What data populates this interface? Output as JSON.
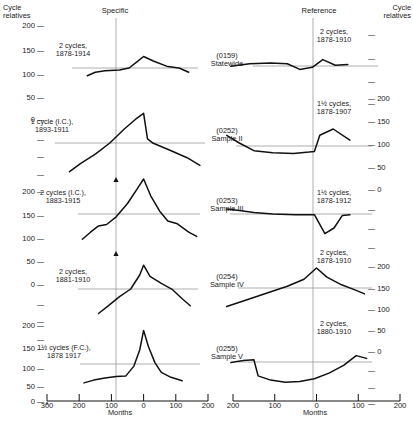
{
  "figure": {
    "left_axis_title": "Cycle\nrelatives",
    "right_axis_title": "Cycle\nrelatives",
    "column_headers": {
      "specific": "Specific",
      "reference": "Reference"
    },
    "x_axis_label_left": "Months",
    "x_axis_label_right": "Months"
  },
  "left_axis_ticks": [
    {
      "label": "200",
      "y": 27
    },
    {
      "label": "150",
      "y": 52
    },
    {
      "label": "100",
      "y": 75
    },
    {
      "label": "50",
      "y": 97
    },
    {
      "label": "0",
      "y": 119
    },
    {
      "label": "",
      "y": 141
    },
    {
      "label": "",
      "y": 160
    },
    {
      "label": "",
      "y": 179
    },
    {
      "label": "200",
      "y": 196
    },
    {
      "label": "150",
      "y": 219
    },
    {
      "label": "100",
      "y": 241
    },
    {
      "label": "50",
      "y": 262
    },
    {
      "label": "0",
      "y": 283
    },
    {
      "label": "",
      "y": 302
    },
    {
      "label": "",
      "y": 320
    },
    {
      "label": "",
      "y": 338
    },
    {
      "label": "200",
      "y": 327
    },
    {
      "label": "150",
      "y": 350
    },
    {
      "label": "100",
      "y": 370
    },
    {
      "label": "50",
      "y": 388
    },
    {
      "label": "0",
      "y": 404
    }
  ],
  "right_axis_ticks": [
    {
      "label": "",
      "y": 37
    },
    {
      "label": "",
      "y": 62
    },
    {
      "label": "",
      "y": 85
    },
    {
      "label": "",
      "y": 107
    },
    {
      "label": "200",
      "y": 100
    },
    {
      "label": "150",
      "y": 123
    },
    {
      "label": "100",
      "y": 145
    },
    {
      "label": "50",
      "y": 167
    },
    {
      "label": "0",
      "y": 189
    },
    {
      "label": "",
      "y": 210
    },
    {
      "label": "",
      "y": 230
    },
    {
      "label": "",
      "y": 250
    },
    {
      "label": "200",
      "y": 268
    },
    {
      "label": "150",
      "y": 290
    },
    {
      "label": "100",
      "y": 311
    },
    {
      "label": "50",
      "y": 332
    },
    {
      "label": "0",
      "y": 353
    },
    {
      "label": "",
      "y": 372
    },
    {
      "label": "",
      "y": 389
    },
    {
      "label": "",
      "y": 405
    }
  ],
  "x_ticks_left": [
    "300",
    "200",
    "100",
    "0",
    "100",
    "200"
  ],
  "x_ticks_right": [
    "200",
    "100",
    "0",
    "100",
    "200"
  ],
  "rows": [
    {
      "center_label": "(0159)\nStatewide",
      "left_annotation": "2 cycles,\n1878-1914",
      "right_annotation": "2 cycles,\n1878-1910"
    },
    {
      "center_label": "(0252)\nSample II",
      "left_annotation": "1 cycle (I.C.),\n1893-1911",
      "right_annotation": "1½ cycles,\n1878-1907"
    },
    {
      "center_label": "(0253)\nSample III",
      "left_annotation": "2 cycles (I.C.),\n1883-1915",
      "right_annotation": "1½ cycles,\n1878-1912"
    },
    {
      "center_label": "(0254)\nSample IV",
      "left_annotation": "2 cycles,\n1881-1910",
      "right_annotation": "2 cycles,\n1878-1910"
    },
    {
      "center_label": "(0255)\nSample V",
      "left_annotation": "1½ cycles (F.C.),\n1878 1917",
      "right_annotation": "2 cycles,\n1880-1910"
    }
  ],
  "chart_data": {
    "type": "line",
    "title": "",
    "xlabel": "Months",
    "ylabel": "Cycle relatives",
    "grid": false,
    "legend": "none",
    "xlim": [
      -300,
      200
    ],
    "panels": [
      {
        "id": "0159-specific",
        "name": "(0159) Statewide - Specific",
        "annotation": "2 cycles, 1878-1914",
        "baseline": 100,
        "points": [
          {
            "x": -175,
            "y": 78
          },
          {
            "x": -150,
            "y": 88
          },
          {
            "x": -120,
            "y": 92
          },
          {
            "x": -75,
            "y": 94
          },
          {
            "x": -45,
            "y": 100
          },
          {
            "x": -20,
            "y": 118
          },
          {
            "x": 0,
            "y": 133
          },
          {
            "x": 30,
            "y": 120
          },
          {
            "x": 75,
            "y": 104
          },
          {
            "x": 110,
            "y": 100
          },
          {
            "x": 140,
            "y": 88
          }
        ]
      },
      {
        "id": "0159-reference",
        "name": "(0159) Statewide - Reference",
        "annotation": "2 cycles, 1878-1910",
        "baseline": 100,
        "points": [
          {
            "x": -205,
            "y": 105
          },
          {
            "x": -160,
            "y": 112
          },
          {
            "x": -110,
            "y": 114
          },
          {
            "x": -70,
            "y": 112
          },
          {
            "x": -40,
            "y": 96
          },
          {
            "x": -10,
            "y": 102
          },
          {
            "x": 15,
            "y": 124
          },
          {
            "x": 45,
            "y": 108
          },
          {
            "x": 75,
            "y": 110
          }
        ]
      },
      {
        "id": "0252-specific",
        "name": "(0252) Sample II - Specific",
        "annotation": "1 cycle (I.C.), 1893-1911",
        "baseline": 100,
        "points": [
          {
            "x": -230,
            "y": 18
          },
          {
            "x": -195,
            "y": 42
          },
          {
            "x": -150,
            "y": 68
          },
          {
            "x": -105,
            "y": 100
          },
          {
            "x": -60,
            "y": 140
          },
          {
            "x": -25,
            "y": 168
          },
          {
            "x": 0,
            "y": 185
          },
          {
            "x": 12,
            "y": 112
          },
          {
            "x": 30,
            "y": 99
          },
          {
            "x": 80,
            "y": 80
          },
          {
            "x": 135,
            "y": 58
          },
          {
            "x": 175,
            "y": 36
          }
        ]
      },
      {
        "id": "0252-reference",
        "name": "(0252) Sample II - Reference",
        "annotation": "1½ cycles, 1878-1907",
        "baseline": 100,
        "points": [
          {
            "x": -215,
            "y": 122
          },
          {
            "x": -185,
            "y": 100
          },
          {
            "x": -150,
            "y": 78
          },
          {
            "x": -105,
            "y": 72
          },
          {
            "x": -55,
            "y": 70
          },
          {
            "x": -18,
            "y": 74
          },
          {
            "x": -5,
            "y": 76
          },
          {
            "x": 8,
            "y": 122
          },
          {
            "x": 40,
            "y": 140
          },
          {
            "x": 80,
            "y": 108
          }
        ]
      },
      {
        "id": "0253-specific",
        "name": "(0253) Sample III - Specific",
        "annotation": "2 cycles (I.C.), 1883-1915",
        "baseline": 100,
        "points": [
          {
            "x": -190,
            "y": 28
          },
          {
            "x": -165,
            "y": 48
          },
          {
            "x": -140,
            "y": 66
          },
          {
            "x": -115,
            "y": 70
          },
          {
            "x": -85,
            "y": 92
          },
          {
            "x": -50,
            "y": 130
          },
          {
            "x": -20,
            "y": 172
          },
          {
            "x": 0,
            "y": 200
          },
          {
            "x": 22,
            "y": 152
          },
          {
            "x": 50,
            "y": 108
          },
          {
            "x": 75,
            "y": 80
          },
          {
            "x": 105,
            "y": 72
          },
          {
            "x": 140,
            "y": 48
          },
          {
            "x": 165,
            "y": 36
          }
        ]
      },
      {
        "id": "0253-reference",
        "name": "(0253) Sample III - Reference",
        "annotation": "1½ cycles, 1878-1912",
        "baseline": 100,
        "points": [
          {
            "x": -215,
            "y": 114
          },
          {
            "x": -185,
            "y": 110
          },
          {
            "x": -150,
            "y": 104
          },
          {
            "x": -105,
            "y": 100
          },
          {
            "x": -50,
            "y": 98
          },
          {
            "x": -5,
            "y": 98
          },
          {
            "x": 20,
            "y": 44
          },
          {
            "x": 42,
            "y": 60
          },
          {
            "x": 62,
            "y": 96
          },
          {
            "x": 80,
            "y": 98
          }
        ]
      },
      {
        "id": "0254-specific",
        "name": "(0254) Sample IV - Specific",
        "annotation": "2 cycles, 1881-1910",
        "baseline": 100,
        "points": [
          {
            "x": -140,
            "y": 30
          },
          {
            "x": -110,
            "y": 52
          },
          {
            "x": -75,
            "y": 78
          },
          {
            "x": -40,
            "y": 100
          },
          {
            "x": -12,
            "y": 140
          },
          {
            "x": 0,
            "y": 168
          },
          {
            "x": 20,
            "y": 136
          },
          {
            "x": 55,
            "y": 116
          },
          {
            "x": 90,
            "y": 98
          },
          {
            "x": 120,
            "y": 72
          },
          {
            "x": 145,
            "y": 52
          }
        ]
      },
      {
        "id": "0254-reference",
        "name": "(0254) Sample IV - Reference",
        "annotation": "2 cycles, 1878-1910",
        "baseline": 100,
        "points": [
          {
            "x": -215,
            "y": 50
          },
          {
            "x": -170,
            "y": 68
          },
          {
            "x": -120,
            "y": 88
          },
          {
            "x": -70,
            "y": 108
          },
          {
            "x": -30,
            "y": 128
          },
          {
            "x": 0,
            "y": 160
          },
          {
            "x": 25,
            "y": 134
          },
          {
            "x": 60,
            "y": 112
          },
          {
            "x": 95,
            "y": 96
          },
          {
            "x": 115,
            "y": 86
          }
        ]
      },
      {
        "id": "0255-specific",
        "name": "(0255) Sample V - Specific",
        "annotation": "1½ cycles (F.C.), 1878 1917",
        "baseline": 100,
        "points": [
          {
            "x": -185,
            "y": 46
          },
          {
            "x": -155,
            "y": 54
          },
          {
            "x": -120,
            "y": 60
          },
          {
            "x": -85,
            "y": 64
          },
          {
            "x": -55,
            "y": 66
          },
          {
            "x": -30,
            "y": 94
          },
          {
            "x": -12,
            "y": 140
          },
          {
            "x": 0,
            "y": 196
          },
          {
            "x": 15,
            "y": 150
          },
          {
            "x": 35,
            "y": 104
          },
          {
            "x": 55,
            "y": 76
          },
          {
            "x": 85,
            "y": 62
          },
          {
            "x": 120,
            "y": 52
          }
        ]
      },
      {
        "id": "0255-reference",
        "name": "(0255) Sample V - Reference",
        "annotation": "2 cycles, 1880-1910",
        "baseline": 100,
        "points": [
          {
            "x": -205,
            "y": 104
          },
          {
            "x": -175,
            "y": 110
          },
          {
            "x": -150,
            "y": 112
          },
          {
            "x": -140,
            "y": 66
          },
          {
            "x": -110,
            "y": 54
          },
          {
            "x": -75,
            "y": 48
          },
          {
            "x": -40,
            "y": 50
          },
          {
            "x": -5,
            "y": 58
          },
          {
            "x": 30,
            "y": 74
          },
          {
            "x": 65,
            "y": 96
          },
          {
            "x": 95,
            "y": 124
          },
          {
            "x": 120,
            "y": 116
          }
        ]
      }
    ]
  }
}
